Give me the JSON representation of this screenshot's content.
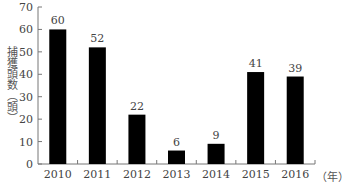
{
  "chart_data": {
    "type": "bar",
    "title": "",
    "categories": [
      "2010",
      "2011",
      "2012",
      "2013",
      "2014",
      "2015",
      "2016"
    ],
    "values": [
      60,
      52,
      22,
      6,
      9,
      41,
      39
    ],
    "xlabel": "（年）",
    "ylabel": "捕獲頭数（頭）",
    "ylim": [
      0,
      70
    ],
    "yticks": [
      0,
      10,
      20,
      30,
      40,
      50,
      60,
      70
    ],
    "grid": false,
    "legend": null,
    "bar_color": "#000000",
    "data_labels": true
  },
  "labels": {
    "ylabel": "捕獲頭数（頭）",
    "xunit": "（年）"
  }
}
